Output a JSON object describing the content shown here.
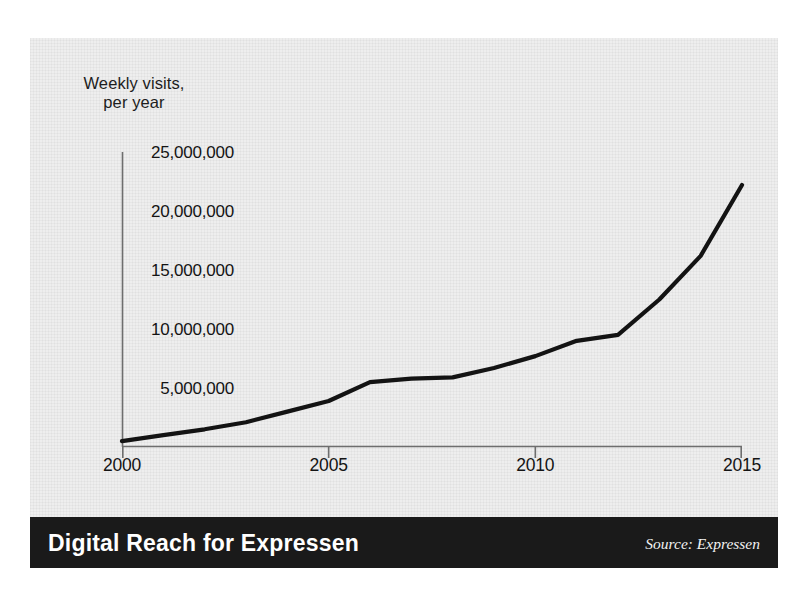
{
  "caption": "Weekly visits,\nper year",
  "banner": {
    "title": "Digital Reach for Expressen",
    "source": "Source: Expressen"
  },
  "colors": {
    "panel_background": "#eeeeee",
    "page_background": "#ffffff",
    "line": "#131313",
    "axis": "#6e6e6e",
    "text": "#141414",
    "banner_background": "#1a1a1a",
    "banner_text": "#ffffff"
  },
  "chart_data": {
    "type": "line",
    "title": "Digital Reach for Expressen",
    "subtitle": "",
    "xlabel": "",
    "ylabel": "Weekly visits, per year",
    "xlim": [
      2000,
      2015
    ],
    "ylim": [
      0,
      25000000
    ],
    "grid": false,
    "legend": false,
    "legend_position": "none",
    "xticks": [
      2000,
      2005,
      2010,
      2015
    ],
    "xticklabels": [
      "2000",
      "2005",
      "2010",
      "2015"
    ],
    "yticks": [
      5000000,
      10000000,
      15000000,
      20000000,
      25000000
    ],
    "yticklabels": [
      "5,000,000",
      "10,000,000",
      "15,000,000",
      "20,000,000",
      "25,000,000"
    ],
    "series": [
      {
        "name": "Weekly visits per year",
        "x": [
          2000,
          2001,
          2002,
          2003,
          2004,
          2005,
          2006,
          2007,
          2008,
          2009,
          2010,
          2011,
          2012,
          2013,
          2014,
          2015
        ],
        "values": [
          500000,
          1000000,
          1500000,
          2100000,
          3000000,
          3900000,
          5500000,
          5800000,
          5900000,
          6700000,
          7700000,
          9000000,
          9500000,
          12500000,
          16200000,
          22200000
        ]
      }
    ],
    "annotations": []
  }
}
